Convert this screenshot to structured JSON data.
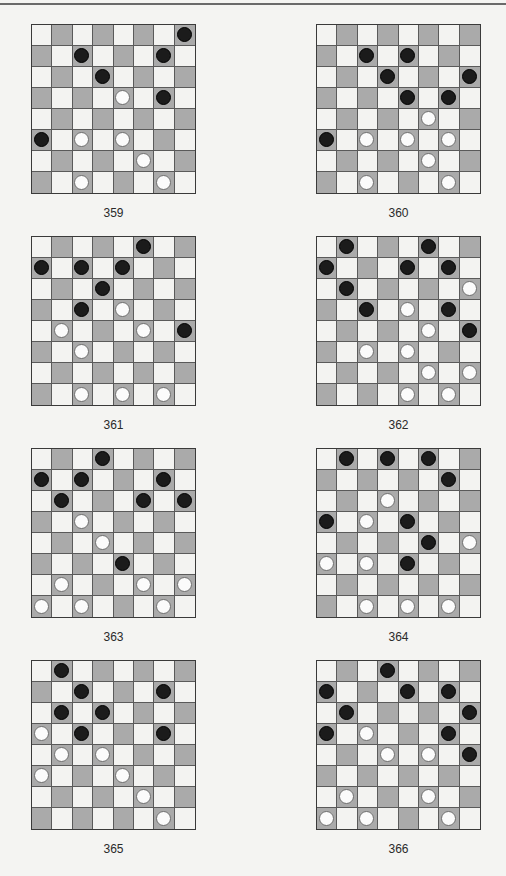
{
  "page": {
    "top_rule": true
  },
  "colors": {
    "light_square": "#f3f3f1",
    "dark_square": "#aaaaaa",
    "black_piece": "#1b1b1b",
    "white_piece": "#fbfbfb"
  },
  "puzzles": [
    {
      "number": "359",
      "pieces": [
        {
          "r": 0,
          "c": 7,
          "color": "black"
        },
        {
          "r": 1,
          "c": 2,
          "color": "black"
        },
        {
          "r": 1,
          "c": 6,
          "color": "black"
        },
        {
          "r": 2,
          "c": 3,
          "color": "black"
        },
        {
          "r": 3,
          "c": 4,
          "color": "white"
        },
        {
          "r": 3,
          "c": 6,
          "color": "black"
        },
        {
          "r": 5,
          "c": 0,
          "color": "black"
        },
        {
          "r": 5,
          "c": 2,
          "color": "white"
        },
        {
          "r": 5,
          "c": 4,
          "color": "white"
        },
        {
          "r": 6,
          "c": 5,
          "color": "white"
        },
        {
          "r": 7,
          "c": 2,
          "color": "white"
        },
        {
          "r": 7,
          "c": 6,
          "color": "white"
        }
      ]
    },
    {
      "number": "360",
      "pieces": [
        {
          "r": 1,
          "c": 2,
          "color": "black"
        },
        {
          "r": 1,
          "c": 4,
          "color": "black"
        },
        {
          "r": 2,
          "c": 3,
          "color": "black"
        },
        {
          "r": 2,
          "c": 7,
          "color": "black"
        },
        {
          "r": 3,
          "c": 4,
          "color": "black"
        },
        {
          "r": 3,
          "c": 6,
          "color": "black"
        },
        {
          "r": 4,
          "c": 5,
          "color": "white"
        },
        {
          "r": 5,
          "c": 0,
          "color": "black"
        },
        {
          "r": 5,
          "c": 2,
          "color": "white"
        },
        {
          "r": 5,
          "c": 4,
          "color": "white"
        },
        {
          "r": 5,
          "c": 6,
          "color": "white"
        },
        {
          "r": 6,
          "c": 5,
          "color": "white"
        },
        {
          "r": 7,
          "c": 2,
          "color": "white"
        },
        {
          "r": 7,
          "c": 6,
          "color": "white"
        }
      ]
    },
    {
      "number": "361",
      "pieces": [
        {
          "r": 0,
          "c": 5,
          "color": "black"
        },
        {
          "r": 1,
          "c": 0,
          "color": "black"
        },
        {
          "r": 1,
          "c": 2,
          "color": "black"
        },
        {
          "r": 1,
          "c": 4,
          "color": "black"
        },
        {
          "r": 2,
          "c": 3,
          "color": "black"
        },
        {
          "r": 3,
          "c": 2,
          "color": "black"
        },
        {
          "r": 3,
          "c": 4,
          "color": "white"
        },
        {
          "r": 4,
          "c": 1,
          "color": "white"
        },
        {
          "r": 4,
          "c": 5,
          "color": "white"
        },
        {
          "r": 4,
          "c": 7,
          "color": "black"
        },
        {
          "r": 5,
          "c": 2,
          "color": "white"
        },
        {
          "r": 7,
          "c": 2,
          "color": "white"
        },
        {
          "r": 7,
          "c": 4,
          "color": "white"
        },
        {
          "r": 7,
          "c": 6,
          "color": "white"
        }
      ]
    },
    {
      "number": "362",
      "pieces": [
        {
          "r": 0,
          "c": 1,
          "color": "black"
        },
        {
          "r": 0,
          "c": 5,
          "color": "black"
        },
        {
          "r": 1,
          "c": 0,
          "color": "black"
        },
        {
          "r": 1,
          "c": 4,
          "color": "black"
        },
        {
          "r": 1,
          "c": 6,
          "color": "black"
        },
        {
          "r": 2,
          "c": 1,
          "color": "black"
        },
        {
          "r": 2,
          "c": 7,
          "color": "white"
        },
        {
          "r": 3,
          "c": 2,
          "color": "black"
        },
        {
          "r": 3,
          "c": 4,
          "color": "white"
        },
        {
          "r": 3,
          "c": 6,
          "color": "black"
        },
        {
          "r": 4,
          "c": 5,
          "color": "white"
        },
        {
          "r": 4,
          "c": 7,
          "color": "black"
        },
        {
          "r": 5,
          "c": 2,
          "color": "white"
        },
        {
          "r": 5,
          "c": 4,
          "color": "white"
        },
        {
          "r": 6,
          "c": 5,
          "color": "white"
        },
        {
          "r": 6,
          "c": 7,
          "color": "white"
        },
        {
          "r": 7,
          "c": 4,
          "color": "white"
        },
        {
          "r": 7,
          "c": 6,
          "color": "white"
        }
      ]
    },
    {
      "number": "363",
      "pieces": [
        {
          "r": 0,
          "c": 3,
          "color": "black"
        },
        {
          "r": 1,
          "c": 0,
          "color": "black"
        },
        {
          "r": 1,
          "c": 2,
          "color": "black"
        },
        {
          "r": 1,
          "c": 6,
          "color": "black"
        },
        {
          "r": 2,
          "c": 1,
          "color": "black"
        },
        {
          "r": 2,
          "c": 5,
          "color": "black"
        },
        {
          "r": 2,
          "c": 7,
          "color": "black"
        },
        {
          "r": 3,
          "c": 2,
          "color": "white"
        },
        {
          "r": 4,
          "c": 3,
          "color": "white"
        },
        {
          "r": 5,
          "c": 4,
          "color": "black"
        },
        {
          "r": 6,
          "c": 1,
          "color": "white"
        },
        {
          "r": 6,
          "c": 5,
          "color": "white"
        },
        {
          "r": 6,
          "c": 7,
          "color": "white"
        },
        {
          "r": 7,
          "c": 0,
          "color": "white"
        },
        {
          "r": 7,
          "c": 2,
          "color": "white"
        },
        {
          "r": 7,
          "c": 6,
          "color": "white"
        }
      ]
    },
    {
      "number": "364",
      "pieces": [
        {
          "r": 0,
          "c": 1,
          "color": "black"
        },
        {
          "r": 0,
          "c": 3,
          "color": "black"
        },
        {
          "r": 0,
          "c": 5,
          "color": "black"
        },
        {
          "r": 1,
          "c": 6,
          "color": "black"
        },
        {
          "r": 2,
          "c": 3,
          "color": "white"
        },
        {
          "r": 3,
          "c": 0,
          "color": "black"
        },
        {
          "r": 3,
          "c": 2,
          "color": "white"
        },
        {
          "r": 3,
          "c": 4,
          "color": "black"
        },
        {
          "r": 4,
          "c": 5,
          "color": "black"
        },
        {
          "r": 4,
          "c": 7,
          "color": "white"
        },
        {
          "r": 5,
          "c": 0,
          "color": "white"
        },
        {
          "r": 5,
          "c": 2,
          "color": "white"
        },
        {
          "r": 5,
          "c": 4,
          "color": "black"
        },
        {
          "r": 7,
          "c": 2,
          "color": "white"
        },
        {
          "r": 7,
          "c": 4,
          "color": "white"
        },
        {
          "r": 7,
          "c": 6,
          "color": "white"
        }
      ]
    },
    {
      "number": "365",
      "pieces": [
        {
          "r": 0,
          "c": 1,
          "color": "black"
        },
        {
          "r": 1,
          "c": 2,
          "color": "black"
        },
        {
          "r": 1,
          "c": 6,
          "color": "black"
        },
        {
          "r": 2,
          "c": 1,
          "color": "black"
        },
        {
          "r": 2,
          "c": 3,
          "color": "black"
        },
        {
          "r": 3,
          "c": 0,
          "color": "white"
        },
        {
          "r": 3,
          "c": 2,
          "color": "black"
        },
        {
          "r": 3,
          "c": 6,
          "color": "black"
        },
        {
          "r": 4,
          "c": 1,
          "color": "white"
        },
        {
          "r": 4,
          "c": 3,
          "color": "white"
        },
        {
          "r": 5,
          "c": 0,
          "color": "white"
        },
        {
          "r": 5,
          "c": 4,
          "color": "white"
        },
        {
          "r": 6,
          "c": 5,
          "color": "white"
        },
        {
          "r": 7,
          "c": 6,
          "color": "white"
        }
      ]
    },
    {
      "number": "366",
      "pieces": [
        {
          "r": 0,
          "c": 3,
          "color": "black"
        },
        {
          "r": 1,
          "c": 0,
          "color": "black"
        },
        {
          "r": 1,
          "c": 4,
          "color": "black"
        },
        {
          "r": 1,
          "c": 6,
          "color": "black"
        },
        {
          "r": 2,
          "c": 1,
          "color": "black"
        },
        {
          "r": 2,
          "c": 7,
          "color": "black"
        },
        {
          "r": 3,
          "c": 0,
          "color": "black"
        },
        {
          "r": 3,
          "c": 2,
          "color": "white"
        },
        {
          "r": 3,
          "c": 6,
          "color": "black"
        },
        {
          "r": 4,
          "c": 3,
          "color": "white"
        },
        {
          "r": 4,
          "c": 5,
          "color": "white"
        },
        {
          "r": 4,
          "c": 7,
          "color": "black"
        },
        {
          "r": 6,
          "c": 1,
          "color": "white"
        },
        {
          "r": 6,
          "c": 5,
          "color": "white"
        },
        {
          "r": 7,
          "c": 0,
          "color": "white"
        },
        {
          "r": 7,
          "c": 2,
          "color": "white"
        },
        {
          "r": 7,
          "c": 6,
          "color": "white"
        }
      ]
    }
  ]
}
